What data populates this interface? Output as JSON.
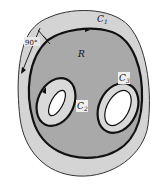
{
  "diagram": {
    "type": "multiply-connected region",
    "region_label": "R",
    "curves": [
      {
        "id": "C1",
        "label": "C",
        "sub": "1",
        "role": "outer boundary"
      },
      {
        "id": "C2",
        "label": "C",
        "sub": "2",
        "role": "inner boundary (left hole)"
      },
      {
        "id": "C3",
        "label": "C",
        "sub": "3",
        "role": "inner boundary (right hole)"
      }
    ],
    "angle_label": "90°",
    "colors": {
      "outer_band": "#d4d4d4",
      "region": "#a9a9a9",
      "inner_band": "#d9d9d9",
      "hole": "#ffffff",
      "stroke": "#111111"
    }
  }
}
